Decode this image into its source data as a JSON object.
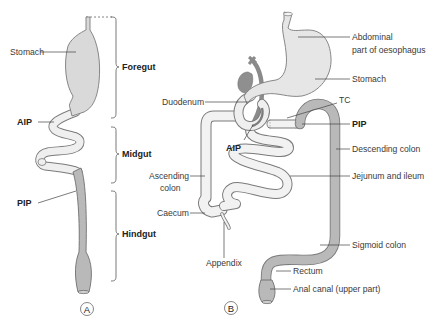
{
  "panel_a": {
    "letter": "A",
    "labels": {
      "stomach": "Stomach",
      "aip": "AIP",
      "pip": "PIP"
    },
    "regions": {
      "foregut": "Foregut",
      "midgut": "Midgut",
      "hindgut": "Hindgut"
    }
  },
  "panel_b": {
    "letter": "B",
    "labels": {
      "abdominal_1": "Abdominal",
      "abdominal_2": "part of oesophagus",
      "stomach": "Stomach",
      "tc": "TC",
      "duodenum": "Duodenum",
      "pip": "PIP",
      "aip": "AIP",
      "descending_colon": "Descending colon",
      "ascending_1": "Ascending",
      "ascending_2": "colon",
      "jejunum_ileum": "Jejunum and ileum",
      "caecum": "Caecum",
      "sigmoid_colon": "Sigmoid colon",
      "appendix": "Appendix",
      "rectum": "Rectum",
      "anal_canal": "Anal canal (upper part)"
    }
  },
  "colors": {
    "foregut_midgut_fill": "#ececec",
    "hindgut_fill": "#b9b9b9",
    "stomach_fill": "#dcdcdc",
    "outline": "#7a7a7a"
  }
}
